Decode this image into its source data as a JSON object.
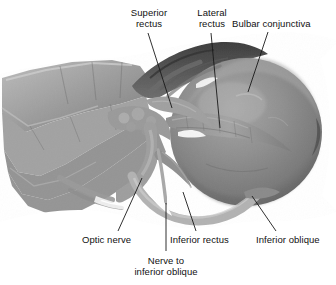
{
  "figure": {
    "kind": "anatomical-photograph",
    "view": "inferolateral",
    "background_color": "#ffffff",
    "label_color": "#111111",
    "leader_color": "#1a1a1a",
    "tissue_mid": "#8a8a8a",
    "tissue_light": "#b4b4b4",
    "tissue_dark": "#4a4a4a",
    "globe_color": "#8d8d8d"
  },
  "labels": [
    {
      "id": "superior-rectus",
      "lines": [
        "Superior",
        "rectus"
      ],
      "x": 118,
      "y": 8,
      "w": 62,
      "align": "center"
    },
    {
      "id": "lateral-rectus",
      "lines": [
        "Lateral",
        "rectus"
      ],
      "x": 185,
      "y": 8,
      "w": 54,
      "align": "center"
    },
    {
      "id": "bulbar-conjunctiva",
      "lines": [
        "Bulbar conjunctiva"
      ],
      "x": 232,
      "y": 19,
      "w": 100,
      "align": "left"
    },
    {
      "id": "optic-nerve",
      "lines": [
        "Optic nerve"
      ],
      "x": 82,
      "y": 235,
      "w": 60,
      "align": "left"
    },
    {
      "id": "inferior-rectus",
      "lines": [
        "Inferior rectus"
      ],
      "x": 170,
      "y": 235,
      "w": 72,
      "align": "left"
    },
    {
      "id": "inferior-oblique",
      "lines": [
        "Inferior oblique"
      ],
      "x": 256,
      "y": 235,
      "w": 76,
      "align": "left"
    },
    {
      "id": "nerve-to-inferior-oblique",
      "lines": [
        "Nerve to",
        "inferior oblique"
      ],
      "x": 118,
      "y": 256,
      "w": 96,
      "align": "center"
    }
  ],
  "leaders": [
    {
      "id": "leader-superior-rectus",
      "x1": 148,
      "y1": 33,
      "x2": 172,
      "y2": 108
    },
    {
      "id": "leader-lateral-rectus",
      "x1": 211,
      "y1": 33,
      "x2": 220,
      "y2": 128
    },
    {
      "id": "leader-bulbar-conjunctiva",
      "x1": 268,
      "y1": 32,
      "x2": 248,
      "y2": 92
    },
    {
      "id": "leader-optic-nerve",
      "x1": 118,
      "y1": 231,
      "x2": 142,
      "y2": 178
    },
    {
      "id": "leader-inferior-rectus",
      "x1": 196,
      "y1": 231,
      "x2": 183,
      "y2": 192
    },
    {
      "id": "leader-inferior-oblique",
      "x1": 276,
      "y1": 231,
      "x2": 252,
      "y2": 196
    },
    {
      "id": "leader-nerve-to-inferior-oblique",
      "x1": 166,
      "y1": 251,
      "x2": 166,
      "y2": 203
    }
  ]
}
